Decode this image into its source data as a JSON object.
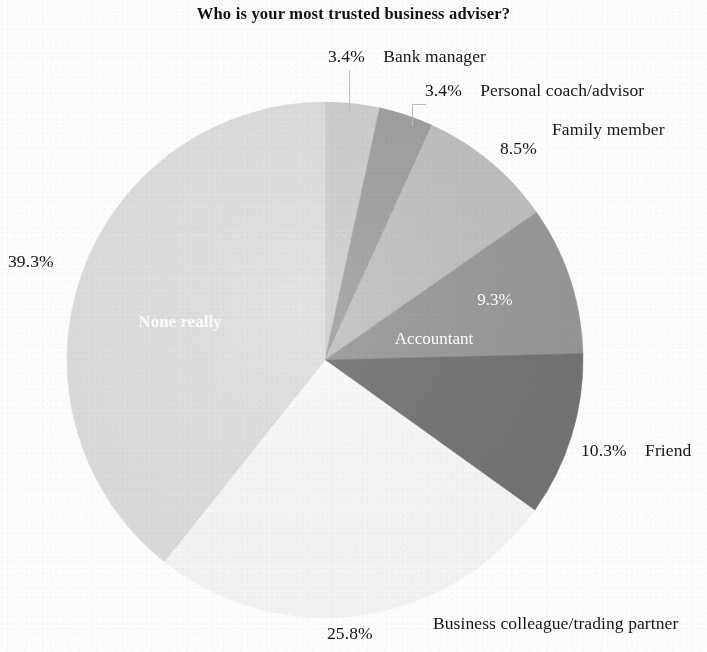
{
  "chart_title": "Who is your most trusted business adviser?",
  "chart_data": {
    "type": "pie",
    "title": "Who is your most trusted business adviser?",
    "xlabel": "",
    "ylabel": "",
    "legend_position": "none",
    "grid": false,
    "value_unit": "%",
    "categories": [
      "Bank manager",
      "Personal coach/advisor",
      "Family member",
      "Accountant",
      "Friend",
      "Business colleague/trading partner",
      "None really"
    ],
    "values": [
      3.4,
      3.4,
      8.5,
      9.3,
      10.3,
      25.8,
      39.3
    ],
    "labels": [
      "3.4%",
      "3.4%",
      "8.5%",
      "9.3%",
      "10.3%",
      "25.8%",
      "39.3%"
    ],
    "colors": [
      "#d2d2d2",
      "#a3a3a3",
      "#c3c3c3",
      "#9a9a9a",
      "#757575",
      "#fdfdfd",
      "#e2e2e2"
    ],
    "slices": [
      {
        "name": "Bank manager",
        "value": 3.4,
        "label": "3.4%",
        "color": "#d2d2d2",
        "label_placement": "outside"
      },
      {
        "name": "Personal coach/advisor",
        "value": 3.4,
        "label": "3.4%",
        "color": "#a3a3a3",
        "label_placement": "outside"
      },
      {
        "name": "Family member",
        "value": 8.5,
        "label": "8.5%",
        "color": "#c3c3c3",
        "label_placement": "outside"
      },
      {
        "name": "Accountant",
        "value": 9.3,
        "label": "9.3%",
        "color": "#9a9a9a",
        "label_placement": "inside"
      },
      {
        "name": "Friend",
        "value": 10.3,
        "label": "10.3%",
        "color": "#757575",
        "label_placement": "outside"
      },
      {
        "name": "Business colleague/trading partner",
        "value": 25.8,
        "label": "25.8%",
        "color": "#fdfdfd",
        "label_placement": "outside"
      },
      {
        "name": "None really",
        "value": 39.3,
        "label": "39.3%",
        "color": "#e2e2e2",
        "label_placement": "split"
      }
    ]
  },
  "labels": {
    "bank_manager": {
      "pct": "3.4%",
      "name": "Bank manager"
    },
    "personal_coach": {
      "pct": "3.4%",
      "name": "Personal coach/advisor"
    },
    "family_member": {
      "pct": "8.5%",
      "name": "Family member"
    },
    "accountant": {
      "pct": "9.3%",
      "name": "Accountant"
    },
    "friend": {
      "pct": "10.3%",
      "name": "Friend"
    },
    "business_colleague": {
      "pct": "25.8%",
      "name": "Business colleague/trading partner"
    },
    "none_really": {
      "pct": "39.3%",
      "name": "None really"
    }
  }
}
